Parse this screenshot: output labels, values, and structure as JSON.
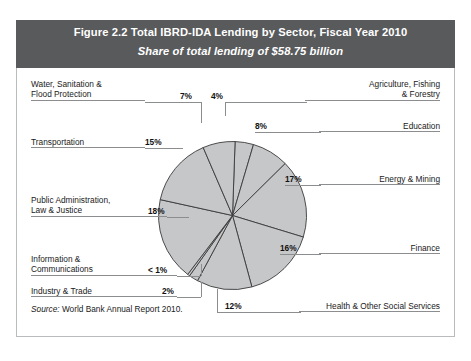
{
  "figure": {
    "title": "Figure 2.2  Total IBRD-IDA Lending by Sector, Fiscal Year 2010",
    "subtitle": "Share of total lending of $58.75 billion",
    "source_label": "Source:",
    "source_text": " World Bank Annual Report 2010."
  },
  "colors": {
    "header_band": "#585a5c",
    "slice_fill": "#c6c7c9",
    "slice_stroke": "#3a3a3a",
    "leader_line": "#8b8d8f",
    "text": "#1a1a1a"
  },
  "labels": {
    "water": {
      "line1": "Water, Sanitation &",
      "line2": "Flood Protection",
      "pct": "7%"
    },
    "transportation": {
      "line1": "Transportation",
      "pct": "15%"
    },
    "public_admin": {
      "line1": "Public Administration,",
      "line2": "Law & Justice",
      "pct": "18%"
    },
    "info_comm": {
      "line1": "Information &",
      "line2": "Communications",
      "pct": "< 1%"
    },
    "industry": {
      "line1": "Industry & Trade",
      "pct": "2%"
    },
    "agriculture": {
      "line1": "Agriculture, Fishing",
      "line2": "& Forestry",
      "pct": "4%"
    },
    "education": {
      "line1": "Education",
      "pct": "8%"
    },
    "energy": {
      "line1": "Energy & Mining",
      "pct": "17%"
    },
    "finance": {
      "line1": "Finance",
      "pct": "16%"
    },
    "health": {
      "line1": "Health & Other Social Services",
      "pct": "12%"
    }
  },
  "chart_data": {
    "type": "pie",
    "title": "Total IBRD-IDA Lending by Sector, Fiscal Year 2010",
    "subtitle": "Share of total lending of $58.75 billion",
    "unit": "percent of total lending",
    "total_label": "$58.75 billion",
    "legend_position": "callouts around pie",
    "grid": false,
    "start_angle_deg": 0,
    "direction": "clockwise",
    "categories": [
      "Agriculture, Fishing & Forestry",
      "Education",
      "Energy & Mining",
      "Finance",
      "Health & Other Social Services",
      "Industry & Trade",
      "Information & Communications",
      "Public Administration, Law & Justice",
      "Transportation",
      "Water, Sanitation & Flood Protection"
    ],
    "values": [
      4,
      8,
      17,
      16,
      12,
      2,
      0.5,
      18,
      15,
      7
    ],
    "value_labels": [
      "4%",
      "8%",
      "17%",
      "16%",
      "12%",
      "2%",
      "< 1%",
      "18%",
      "15%",
      "7%"
    ],
    "slices": [
      {
        "label": "Agriculture, Fishing & Forestry",
        "value": 4,
        "display": "4%"
      },
      {
        "label": "Education",
        "value": 8,
        "display": "8%"
      },
      {
        "label": "Energy & Mining",
        "value": 17,
        "display": "17%"
      },
      {
        "label": "Finance",
        "value": 16,
        "display": "16%"
      },
      {
        "label": "Health & Other Social Services",
        "value": 12,
        "display": "12%"
      },
      {
        "label": "Industry & Trade",
        "value": 2,
        "display": "2%"
      },
      {
        "label": "Information & Communications",
        "value": 0.5,
        "display": "< 1%"
      },
      {
        "label": "Public Administration, Law & Justice",
        "value": 18,
        "display": "18%"
      },
      {
        "label": "Transportation",
        "value": 15,
        "display": "15%"
      },
      {
        "label": "Water, Sanitation & Flood Protection",
        "value": 7,
        "display": "7%"
      }
    ]
  }
}
